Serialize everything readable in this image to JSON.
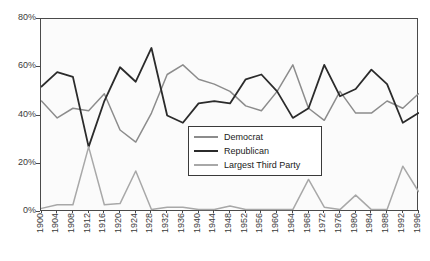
{
  "chart_data": {
    "type": "line",
    "title": "",
    "xlabel": "",
    "ylabel": "",
    "ylim": [
      0,
      80
    ],
    "ytick_labels": [
      "0%",
      "20%",
      "40%",
      "60%",
      "80%"
    ],
    "ytick_values": [
      0,
      20,
      40,
      60,
      80
    ],
    "grid": false,
    "legend_position": "center-right-inside",
    "x": [
      1900,
      1904,
      1908,
      1912,
      1916,
      1920,
      1924,
      1928,
      1932,
      1936,
      1940,
      1944,
      1948,
      1952,
      1956,
      1960,
      1964,
      1968,
      1972,
      1976,
      1980,
      1984,
      1988,
      1992,
      1996
    ],
    "categories": [
      "1900",
      "1904",
      "1908",
      "1912",
      "1916",
      "1920",
      "1924",
      "1928",
      "1932",
      "1936",
      "1940",
      "1944",
      "1948",
      "1952",
      "1956",
      "1960",
      "1964",
      "1968",
      "1972",
      "1976",
      "1980",
      "1984",
      "1988",
      "1992",
      "1996"
    ],
    "series": [
      {
        "name": "Democrat",
        "color": "#8c8c8c",
        "values": [
          46,
          39,
          43,
          42,
          49,
          34,
          29,
          41,
          57,
          61,
          55,
          53,
          50,
          44,
          42,
          50,
          61,
          43,
          38,
          50,
          41,
          41,
          46,
          43,
          49
        ]
      },
      {
        "name": "Republican",
        "color": "#2b2b2b",
        "values": [
          52,
          58,
          56,
          27,
          46,
          60,
          54,
          68,
          40,
          37,
          45,
          46,
          45,
          55,
          57,
          50,
          39,
          43,
          61,
          48,
          51,
          59,
          53,
          37,
          41
        ]
      },
      {
        "name": "Largest Third Party",
        "color": "#a8a8a8",
        "values": [
          1.5,
          3,
          3,
          27,
          3,
          3.5,
          17,
          1,
          2,
          2,
          1,
          1,
          2.5,
          1,
          1,
          1,
          1,
          13.5,
          2,
          1,
          7,
          1,
          1,
          19,
          8.5
        ]
      }
    ]
  },
  "legend": {
    "items": [
      {
        "label": "Democrat",
        "color": "#8c8c8c"
      },
      {
        "label": "Republican",
        "color": "#2b2b2b"
      },
      {
        "label": "Largest Third Party",
        "color": "#a8a8a8"
      }
    ]
  }
}
